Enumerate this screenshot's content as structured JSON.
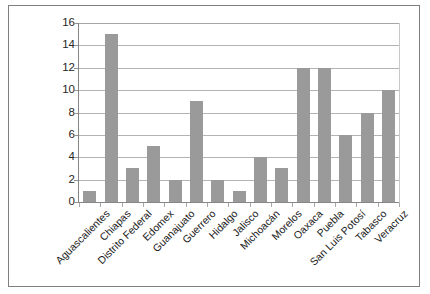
{
  "chart_data": {
    "type": "bar",
    "title": "",
    "subtitle": "",
    "xlabel": "",
    "ylabel": "",
    "ylim": [
      0,
      16
    ],
    "ytick_step": 2,
    "yticks": [
      16,
      14,
      12,
      10,
      8,
      6,
      4,
      2,
      0
    ],
    "grid": true,
    "legend": false,
    "legend_position": "none",
    "orientation": "vertical",
    "bar_color": "#9a9a9a",
    "gridline_color": "#b3b3b3",
    "axis_color": "#868686",
    "frame_color": "#7f7f7f",
    "background_color": "#ffffff",
    "xlabel_rotation": -45,
    "categories": [
      "Aguascalientes",
      "Chiapas",
      "Distrito Federal",
      "Edomex",
      "Guanajuato",
      "Guerrero",
      "Hidalgo",
      "Jalisco",
      "Michoacán",
      "Morelos",
      "Oaxaca",
      "Puebla",
      "San Luis Potosí",
      "Tabasco",
      "Veracruz"
    ],
    "values": [
      1,
      15,
      3,
      5,
      2,
      9,
      2,
      1,
      4,
      3,
      12,
      12,
      6,
      8,
      10
    ],
    "points": [
      {
        "category": "Aguascalientes",
        "value": 1
      },
      {
        "category": "Chiapas",
        "value": 15
      },
      {
        "category": "Distrito Federal",
        "value": 3
      },
      {
        "category": "Edomex",
        "value": 5
      },
      {
        "category": "Guanajuato",
        "value": 2
      },
      {
        "category": "Guerrero",
        "value": 9
      },
      {
        "category": "Hidalgo",
        "value": 2
      },
      {
        "category": "Jalisco",
        "value": 1
      },
      {
        "category": "Michoacán",
        "value": 4
      },
      {
        "category": "Morelos",
        "value": 3
      },
      {
        "category": "Oaxaca",
        "value": 12
      },
      {
        "category": "Puebla",
        "value": 12
      },
      {
        "category": "San Luis Potosí",
        "value": 6
      },
      {
        "category": "Tabasco",
        "value": 8
      },
      {
        "category": "Veracruz",
        "value": 10
      }
    ]
  }
}
